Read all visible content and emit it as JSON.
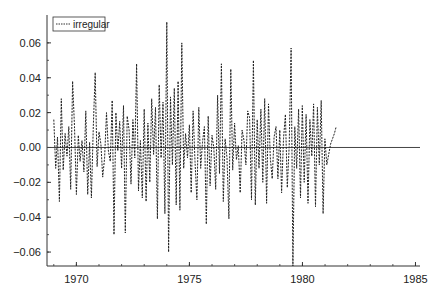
{
  "chart_data": {
    "type": "line",
    "title": "",
    "xlabel": "",
    "ylabel": "",
    "xlim": [
      1968.7,
      1985.2
    ],
    "ylim": [
      -0.068,
      0.076
    ],
    "x_ticks": [
      1970,
      1975,
      1980,
      1985
    ],
    "y_ticks": [
      -0.06,
      -0.04,
      -0.02,
      0.0,
      0.02,
      0.04,
      0.06
    ],
    "y_tick_labels": [
      "−0.06",
      "−0.04",
      "−0.02",
      "0.00",
      "0.02",
      "0.04",
      "0.06"
    ],
    "grid": false,
    "zero_line": true,
    "legend": {
      "position": "upper-left",
      "entries": [
        "irregular"
      ]
    },
    "series": [
      {
        "name": "irregular",
        "style": "dashed",
        "color": "#222222",
        "x_start": 1969.0,
        "x_step": 0.0833,
        "values": [
          0.016,
          -0.012,
          0.006,
          -0.031,
          0.028,
          -0.013,
          0.008,
          -0.005,
          0.012,
          -0.024,
          0.038,
          0.012,
          -0.027,
          0.007,
          -0.008,
          0.004,
          -0.014,
          0.021,
          -0.027,
          0.003,
          -0.029,
          0.012,
          0.043,
          -0.011,
          0.009,
          0.002,
          -0.017,
          -0.006,
          0.02,
          -0.002,
          -0.008,
          0.027,
          -0.05,
          0.02,
          -0.002,
          0.015,
          -0.012,
          0.024,
          -0.049,
          0.018,
          0.01,
          -0.021,
          0.016,
          -0.006,
          0.048,
          -0.025,
          0.004,
          -0.029,
          0.022,
          -0.031,
          0.014,
          -0.02,
          0.028,
          -0.004,
          0.023,
          -0.041,
          0.036,
          -0.006,
          0.026,
          -0.038,
          0.072,
          -0.06,
          0.029,
          -0.01,
          0.034,
          -0.033,
          0.038,
          -0.036,
          0.06,
          -0.012,
          0.008,
          -0.006,
          0.013,
          -0.026,
          0.021,
          -0.008,
          -0.03,
          0.023,
          -0.012,
          0.003,
          0.012,
          -0.044,
          0.018,
          -0.022,
          0.007,
          0.0,
          -0.024,
          0.03,
          -0.015,
          0.048,
          -0.031,
          0.005,
          -0.006,
          -0.041,
          0.045,
          -0.013,
          0.014,
          -0.007,
          0.001,
          -0.026,
          0.01,
          0.004,
          -0.01,
          0.021,
          0.017,
          -0.03,
          0.05,
          -0.033,
          0.016,
          -0.012,
          0.022,
          -0.02,
          0.028,
          -0.032,
          0.025,
          -0.006,
          -0.018,
          0.006,
          0.012,
          -0.018,
          0.01,
          -0.026,
          0.005,
          0.019,
          -0.023,
          0.001,
          0.057,
          -0.068,
          0.012,
          -0.012,
          0.022,
          -0.029,
          0.024,
          -0.02,
          0.019,
          -0.032,
          0.016,
          -0.005,
          0.025,
          -0.034,
          0.023,
          -0.01,
          0.027,
          -0.038,
          0.005,
          -0.01,
          -0.004,
          0.002,
          0.005,
          0.008,
          0.012
        ]
      }
    ]
  }
}
